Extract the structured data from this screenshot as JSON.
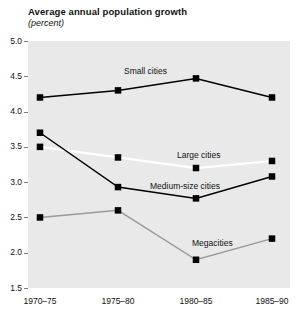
{
  "header": {
    "title": "Average annual population growth",
    "subtitle": "(percent)"
  },
  "chart_data": {
    "type": "line",
    "title": "Average annual population growth",
    "subtitle": "(percent)",
    "xlabel": "",
    "ylabel": "percent",
    "ylim": [
      1.5,
      5.0
    ],
    "ytick_step": 0.5,
    "grid": false,
    "legend_position": "inline-labels",
    "categories": [
      "1970–75",
      "1975–80",
      "1980–85",
      "1985–90"
    ],
    "yticks": [
      "5.0",
      "4.5",
      "4.0",
      "3.5",
      "3.0",
      "2.5",
      "2.0",
      "1.5"
    ],
    "series": [
      {
        "name": "Small cities",
        "color": "#000000",
        "marker": "square",
        "marker_color": "#000000",
        "values": [
          4.2,
          4.3,
          4.47,
          4.2
        ]
      },
      {
        "name": "Large cities",
        "color": "#ffffff",
        "marker": "square",
        "marker_color": "#000000",
        "values": [
          3.5,
          3.35,
          3.2,
          3.3
        ]
      },
      {
        "name": "Medium-size cities",
        "color": "#000000",
        "marker": "square",
        "marker_color": "#000000",
        "values": [
          3.7,
          2.93,
          2.77,
          3.08
        ]
      },
      {
        "name": "Megacities",
        "color": "#9a9a9a",
        "marker": "square",
        "marker_color": "#000000",
        "values": [
          2.5,
          2.6,
          1.9,
          2.2
        ]
      }
    ],
    "annotations": [
      {
        "text": "Small cities",
        "x": 124,
        "y": 66
      },
      {
        "text": "Large cities",
        "x": 177,
        "y": 150
      },
      {
        "text": "Medium-size cities",
        "x": 150,
        "y": 181
      },
      {
        "text": "Megacities",
        "x": 192,
        "y": 238
      }
    ],
    "plot_background": "#e9e9e9"
  }
}
